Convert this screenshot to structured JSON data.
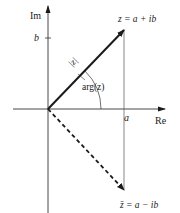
{
  "diagram": {
    "axes": {
      "real_label": "Re",
      "imag_label": "Im",
      "real_tick_label": "a",
      "imag_tick_label": "b"
    },
    "vectors": {
      "z_label": "z = a + ib",
      "z_conj_label": "z̄ = a − ib",
      "modulus_label": "|z|",
      "argument_label": "arg(z)"
    },
    "colors": {
      "line": "#1a1a1a",
      "axis": "#333333",
      "guide": "#555555"
    }
  }
}
